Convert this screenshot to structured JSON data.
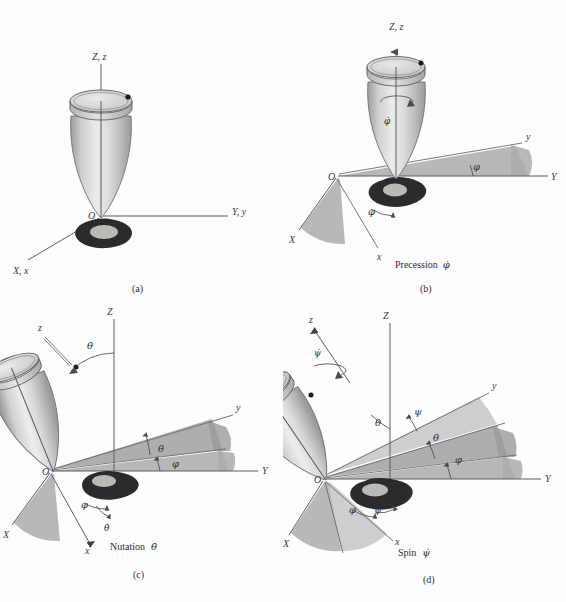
{
  "figure": {
    "background": "#fdfdfd",
    "ink": "#3a3a3c",
    "sector_color": "#ababad"
  },
  "panels": [
    {
      "id": "(a)",
      "key": "a",
      "caption": "",
      "origin_label": "O",
      "axes": [
        {
          "name": "vertical",
          "label": "Z, z"
        },
        {
          "name": "right",
          "label": "Y, y"
        },
        {
          "name": "left",
          "label": "X, x"
        }
      ],
      "angles": [],
      "rate_labels": []
    },
    {
      "id": "(b)",
      "key": "b",
      "caption": "Precession",
      "caption_symbol": "φ̇",
      "origin_label": "O",
      "axes": [
        {
          "name": "vertical",
          "label": "Z, z"
        },
        {
          "name": "fixed-right",
          "label": "Y"
        },
        {
          "name": "body-right",
          "label": "y"
        },
        {
          "name": "fixed-left",
          "label": "X"
        },
        {
          "name": "body-left",
          "label": "x"
        }
      ],
      "angles": [
        {
          "symbol": "φ",
          "between": "Y-y"
        },
        {
          "symbol": "φ",
          "between": "X-x"
        }
      ],
      "rate_labels": [
        {
          "symbol": "φ̇",
          "location": "top-body"
        }
      ]
    },
    {
      "id": "(c)",
      "key": "c",
      "caption": "Nutation",
      "caption_symbol": "θ̇",
      "origin_label": "O",
      "axes": [
        {
          "name": "fixed-vertical",
          "label": "Z"
        },
        {
          "name": "body-vertical",
          "label": "z"
        },
        {
          "name": "fixed-right",
          "label": "Y"
        },
        {
          "name": "body-right",
          "label": "y"
        },
        {
          "name": "fixed-left",
          "label": "X"
        },
        {
          "name": "body-left",
          "label": "x"
        }
      ],
      "angles": [
        {
          "symbol": "θ",
          "between": "Z-z"
        },
        {
          "symbol": "θ",
          "between": "line-of-nodes-y"
        },
        {
          "symbol": "φ",
          "between": "Y-nodes"
        },
        {
          "symbol": "φ",
          "between": "X-x"
        }
      ],
      "rate_labels": [
        {
          "symbol": "θ̇",
          "location": "x-axis"
        }
      ]
    },
    {
      "id": "(d)",
      "key": "d",
      "caption": "Spin",
      "caption_symbol": "ψ̇",
      "origin_label": "O",
      "axes": [
        {
          "name": "fixed-vertical",
          "label": "Z"
        },
        {
          "name": "body-vertical",
          "label": "z"
        },
        {
          "name": "fixed-right",
          "label": "Y"
        },
        {
          "name": "body-right",
          "label": "y"
        },
        {
          "name": "fixed-left",
          "label": "X"
        },
        {
          "name": "body-left",
          "label": "x"
        }
      ],
      "angles": [
        {
          "symbol": "θ",
          "between": "Z-z"
        },
        {
          "symbol": "ψ",
          "between": "nodes-y"
        },
        {
          "symbol": "θ",
          "between": "mid-sector"
        },
        {
          "symbol": "φ",
          "between": "Y-nodes"
        },
        {
          "symbol": "φ",
          "between": "X-side-outer"
        },
        {
          "symbol": "ψ",
          "between": "X-side-inner"
        }
      ],
      "rate_labels": [
        {
          "symbol": "ψ̇",
          "location": "z-axis"
        }
      ]
    }
  ]
}
